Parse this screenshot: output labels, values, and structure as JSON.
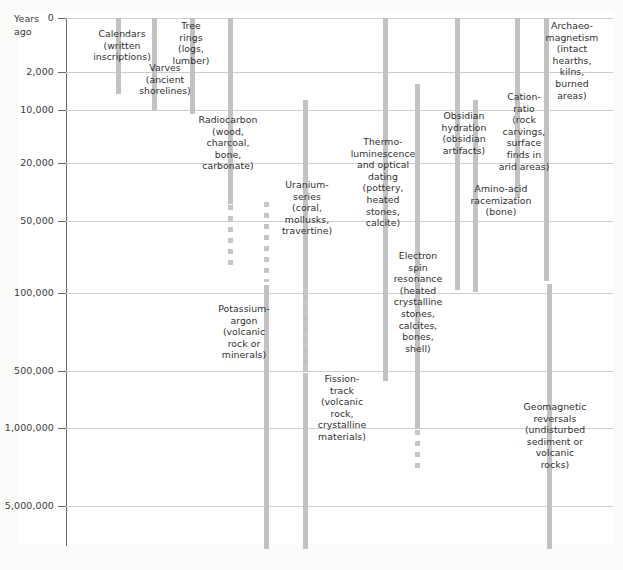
{
  "figure": {
    "axis_title": "Years\nago",
    "axis_title_line1": "Years",
    "axis_title_line2": "ago",
    "background_color": "#fbfbfa",
    "panel_color": "#ffffff",
    "bar_color": "#c2c2c2",
    "grid_color": "#cfcfcf",
    "axis_color": "#6d6d6d",
    "text_color": "#2f2f2f"
  },
  "chart_data": {
    "type": "bar",
    "title": "",
    "xlabel": "",
    "ylabel": "Years ago",
    "orientation": "vertical-ranges",
    "grid": true,
    "legend": "none",
    "y_axis_scale": "nonlinear-ordinal",
    "y_tick_labels": [
      "0",
      "2,000",
      "10,000",
      "20,000",
      "50,000",
      "100,000",
      "500,000",
      "1,000,000",
      "5,000,000"
    ],
    "y_tick_values": [
      0,
      2000,
      10000,
      20000,
      50000,
      100000,
      500000,
      1000000,
      5000000
    ],
    "y_tick_pixels": [
      18,
      72,
      110,
      163,
      221,
      293,
      371,
      428,
      506
    ],
    "categories": [
      "Calendars (written inscriptions)",
      "Varves (ancient shorelines)",
      "Tree rings (logs, lumber)",
      "Radiocarbon (wood, charcoal, bone, carbonate)",
      "Uranium-series (coral, mollusks, travertine)",
      "Potassium-argon (volcanic rock or minerals)",
      "Fission-track (volcanic rock, crystalline materials)",
      "Thermo-luminescence and optical dating (pottery, heated stones, calcite)",
      "Electron spin resonance (heated crystalline stones, calcites, bones, shell)",
      "Obsidian hydration (obsidian artifacts)",
      "Amino-acid racemization (bone)",
      "Cation-ratio (rock carvings, surface finds in arid areas)",
      "Archaeomagnetism (intact hearths, kilns, burned areas)",
      "Geomagnetic reversals (undisturbed sediment or volcanic rocks)"
    ],
    "ranges": [
      {
        "name": "Calendars",
        "start_years": 0,
        "end_years": 5000,
        "uncertain": false
      },
      {
        "name": "Varves",
        "start_years": 0,
        "end_years": 10000,
        "uncertain": false
      },
      {
        "name": "Tree rings",
        "start_years": 0,
        "end_years": 11000,
        "uncertain": false
      },
      {
        "name": "Radiocarbon",
        "start_years": 0,
        "end_years": 50000,
        "uncertain_to_years": 75000
      },
      {
        "name": "Uranium-series",
        "start_years": 7000,
        "end_years": 500000,
        "uncertain_to_years": 800000
      },
      {
        "name": "Potassium-argon",
        "start_years": 100000,
        "end_years": 5000000,
        "uncertain": false
      },
      {
        "name": "Fission-track",
        "start_years": 20000,
        "end_years": 5000000,
        "uncertain_from_years": 20000
      },
      {
        "name": "Thermoluminescence and optical dating",
        "start_years": 0,
        "end_years": 500000,
        "uncertain": false
      },
      {
        "name": "Electron spin resonance",
        "start_years": 3000,
        "end_years": 1000000,
        "uncertain_to_years": 2000000
      },
      {
        "name": "Obsidian hydration",
        "start_years": 0,
        "end_years": 500000,
        "uncertain_to_years": 800000
      },
      {
        "name": "Amino-acid racemization",
        "start_years": 500,
        "end_years": 100000,
        "uncertain": false
      },
      {
        "name": "Cation-ratio",
        "start_years": 0,
        "end_years": 30000,
        "uncertain": false
      },
      {
        "name": "Archaeomagnetism",
        "start_years": 0,
        "end_years": 100000,
        "uncertain": false
      },
      {
        "name": "Geomagnetic reversals",
        "start_years": 100000,
        "end_years": 5000000,
        "uncertain": false
      }
    ]
  },
  "ticks": [
    {
      "label": "0",
      "top": 18
    },
    {
      "label": "2,000",
      "top": 72
    },
    {
      "label": "10,000",
      "top": 110
    },
    {
      "label": "20,000",
      "top": 163
    },
    {
      "label": "50,000",
      "top": 221
    },
    {
      "label": "100,000",
      "top": 293
    },
    {
      "label": "500,000",
      "top": 371
    },
    {
      "label": "1,000,000",
      "top": 428
    },
    {
      "label": "5,000,000",
      "top": 506
    }
  ],
  "methods": [
    {
      "id": "calendars",
      "name": "Calendars",
      "label_lines": [
        "Calendars",
        "(written",
        "inscriptions)"
      ],
      "label_left": 78,
      "label_top": 28,
      "label_width": 88,
      "label_align": "c",
      "bar_left": 116,
      "bar_top": 18,
      "bar_height": 76,
      "dash_top": 0,
      "dash_height": 0
    },
    {
      "id": "varves",
      "name": "Varves",
      "label_lines": [
        "Varves",
        "(ancient",
        "shorelines)"
      ],
      "label_left": 126,
      "label_top": 62,
      "label_width": 78,
      "label_align": "c",
      "bar_left": 152,
      "bar_top": 18,
      "bar_height": 92,
      "dash_top": 0,
      "dash_height": 0
    },
    {
      "id": "tree-rings",
      "name": "Tree rings",
      "label_lines": [
        "Tree",
        "rings",
        "(logs,",
        "lumber)"
      ],
      "label_left": 166,
      "label_top": 20,
      "label_width": 50,
      "label_align": "c",
      "bar_left": 190,
      "bar_top": 18,
      "bar_height": 96,
      "dash_top": 0,
      "dash_height": 0
    },
    {
      "id": "radiocarbon",
      "name": "Radiocarbon",
      "label_lines": [
        "Radiocarbon",
        "(wood,",
        "charcoal,",
        "bone,",
        "carbonate)"
      ],
      "label_left": 180,
      "label_top": 114,
      "label_width": 96,
      "label_align": "c",
      "bar_left": 228,
      "bar_top": 18,
      "bar_height": 186,
      "dash_top": 205,
      "dash_height": 61
    },
    {
      "id": "uranium-series",
      "name": "Uranium-series",
      "label_lines": [
        "Uranium-",
        "series",
        "(coral,",
        "mollusks,",
        "travertine)"
      ],
      "label_left": 268,
      "label_top": 179,
      "label_width": 78,
      "label_align": "c",
      "bar_left": 303,
      "bar_top": 100,
      "bar_height": 272,
      "dash_top": 200,
      "dash_height": 0
    },
    {
      "id": "uranium-series-dash",
      "name": "Uranium-series uncertainty",
      "label_lines": [],
      "label_left": 0,
      "label_top": 0,
      "label_width": 0,
      "label_align": "c",
      "bar_left": 264,
      "bar_top": 202,
      "bar_height": 80,
      "dash_top": 202,
      "dash_height": 80
    },
    {
      "id": "potassium-argon",
      "name": "Potassium-argon",
      "label_lines": [
        "Potassium-",
        "argon",
        "(volcanic",
        "rock or",
        "minerals)"
      ],
      "label_left": 200,
      "label_top": 303,
      "label_width": 88,
      "label_align": "c",
      "bar_left": 264,
      "bar_top": 285,
      "bar_height": 264,
      "dash_top": 0,
      "dash_height": 0
    },
    {
      "id": "fission-track",
      "name": "Fission-track",
      "label_lines": [
        "Fission-",
        "track",
        "(volcanic",
        "rock,",
        "crystalline",
        "materials)"
      ],
      "label_left": 300,
      "label_top": 373,
      "label_width": 84,
      "label_align": "c",
      "bar_left": 303,
      "bar_top": 373,
      "bar_height": 176,
      "dash_top": 288,
      "dash_height": 84
    },
    {
      "id": "thermoluminescence",
      "name": "Thermoluminescence",
      "label_lines": [
        "Thermo-",
        "luminescence",
        "and optical",
        "dating",
        "(pottery,",
        "heated",
        "stones,",
        "calcite)"
      ],
      "label_left": 340,
      "label_top": 136,
      "label_width": 86,
      "label_align": "c",
      "bar_left": 383,
      "bar_top": 18,
      "bar_height": 363,
      "dash_top": 0,
      "dash_height": 0
    },
    {
      "id": "electron-spin-resonance",
      "name": "Electron spin resonance",
      "label_lines": [
        "Electron",
        "spin",
        "resonance",
        "(heated",
        "crystalline",
        "stones,",
        "calcites,",
        "bones,",
        "shell)"
      ],
      "label_left": 378,
      "label_top": 250,
      "label_width": 80,
      "label_align": "c",
      "bar_left": 415,
      "bar_top": 84,
      "bar_height": 344,
      "dash_top": 430,
      "dash_height": 40
    },
    {
      "id": "obsidian-hydration",
      "name": "Obsidian hydration",
      "label_lines": [
        "Obsidian",
        "hydration",
        "(obsidian",
        "artifacts)"
      ],
      "label_left": 428,
      "label_top": 110,
      "label_width": 72,
      "label_align": "c",
      "bar_left": 455,
      "bar_top": 18,
      "bar_height": 272,
      "dash_top": 0,
      "dash_height": 0
    },
    {
      "id": "amino-acid-racemization",
      "name": "Amino-acid racemization",
      "label_lines": [
        "Amino-acid",
        "racemization",
        "(bone)"
      ],
      "label_left": 452,
      "label_top": 183,
      "label_width": 98,
      "label_align": "c",
      "bar_left": 473,
      "bar_top": 100,
      "bar_height": 192,
      "dash_top": 0,
      "dash_height": 0
    },
    {
      "id": "cation-ratio",
      "name": "Cation-ratio",
      "label_lines": [
        "Cation-",
        "ratio",
        "(rock",
        "carvings,",
        "surface",
        "finds in",
        "arid areas)"
      ],
      "label_left": 487,
      "label_top": 91,
      "label_width": 74,
      "label_align": "c",
      "bar_left": 515,
      "bar_top": 18,
      "bar_height": 180,
      "dash_top": 0,
      "dash_height": 0
    },
    {
      "id": "archaeomagnetism",
      "name": "Archaeomagnetism",
      "label_lines": [
        "Archaeo-",
        "magnetism",
        "(intact",
        "hearths,",
        "kilns,",
        "burned",
        "areas)"
      ],
      "label_left": 532,
      "label_top": 20,
      "label_width": 80,
      "label_align": "c",
      "bar_left": 544,
      "bar_top": 18,
      "bar_height": 263,
      "dash_top": 0,
      "dash_height": 0
    },
    {
      "id": "geomagnetic-reversals",
      "name": "Geomagnetic reversals",
      "label_lines": [
        "Geomagnetic",
        "reversals",
        "(undisturbed",
        "sediment or",
        "volcanic",
        "rocks)"
      ],
      "label_left": 506,
      "label_top": 401,
      "label_width": 98,
      "label_align": "c",
      "bar_left": 547,
      "bar_top": 284,
      "bar_height": 265,
      "dash_top": 0,
      "dash_height": 0
    }
  ],
  "caption": ""
}
